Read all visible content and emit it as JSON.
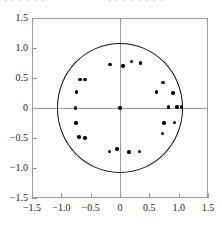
{
  "page": {
    "kind": "scatter-plot-figure",
    "background": "#ffffff",
    "cropped_text_above": "partially cropped line of text, illegible"
  },
  "chart_data": {
    "type": "scatter",
    "title": "",
    "xlabel": "",
    "ylabel": "",
    "xlim": [
      -1.5,
      1.5
    ],
    "ylim": [
      -1.5,
      1.5
    ],
    "grid": false,
    "legend": "none",
    "axis_lines": {
      "x_at": 0,
      "y_at": 0,
      "color": "#9a9a9a"
    },
    "xticks": [
      -1.5,
      -1.0,
      -0.5,
      0,
      0.5,
      1.0,
      1.5
    ],
    "xticklabels": [
      "-1.5",
      "-1.0",
      "-0.5",
      "0",
      "0.5",
      "1.0",
      "1.5"
    ],
    "yticks": [
      -1.5,
      -1.0,
      -0.5,
      0,
      0.5,
      1.0,
      1.5
    ],
    "yticklabels": [
      "-1.5",
      "-1.0",
      "-0.5",
      "0",
      "0.5",
      "1.0",
      "1.5"
    ],
    "annotations": [
      {
        "shape": "circle",
        "center": [
          0,
          0
        ],
        "radius": 1.08,
        "fill": "none",
        "stroke": "#111111",
        "stroke_width": 1
      }
    ],
    "series": [
      {
        "name": "roots",
        "marker": "filled-circle",
        "color": "#000000",
        "marker_size": 3.4,
        "points": [
          [
            0.0,
            0.0
          ],
          [
            -0.17,
            0.73
          ],
          [
            0.05,
            0.7
          ],
          [
            0.2,
            0.78
          ],
          [
            0.35,
            0.75
          ],
          [
            -0.68,
            0.48
          ],
          [
            -0.6,
            0.48
          ],
          [
            -0.74,
            0.27
          ],
          [
            0.73,
            0.43
          ],
          [
            0.62,
            0.27
          ],
          [
            0.9,
            0.25
          ],
          [
            -0.76,
            0.0
          ],
          [
            0.83,
            0.02
          ],
          [
            0.97,
            0.02
          ],
          [
            1.05,
            0.02
          ],
          [
            -0.75,
            -0.25
          ],
          [
            0.75,
            -0.25
          ],
          [
            0.93,
            -0.24
          ],
          [
            -0.7,
            -0.48
          ],
          [
            -0.6,
            -0.5
          ],
          [
            0.72,
            -0.42
          ],
          [
            -0.18,
            -0.72
          ],
          [
            -0.05,
            -0.68
          ],
          [
            0.15,
            -0.73
          ],
          [
            0.33,
            -0.72
          ]
        ]
      }
    ]
  }
}
